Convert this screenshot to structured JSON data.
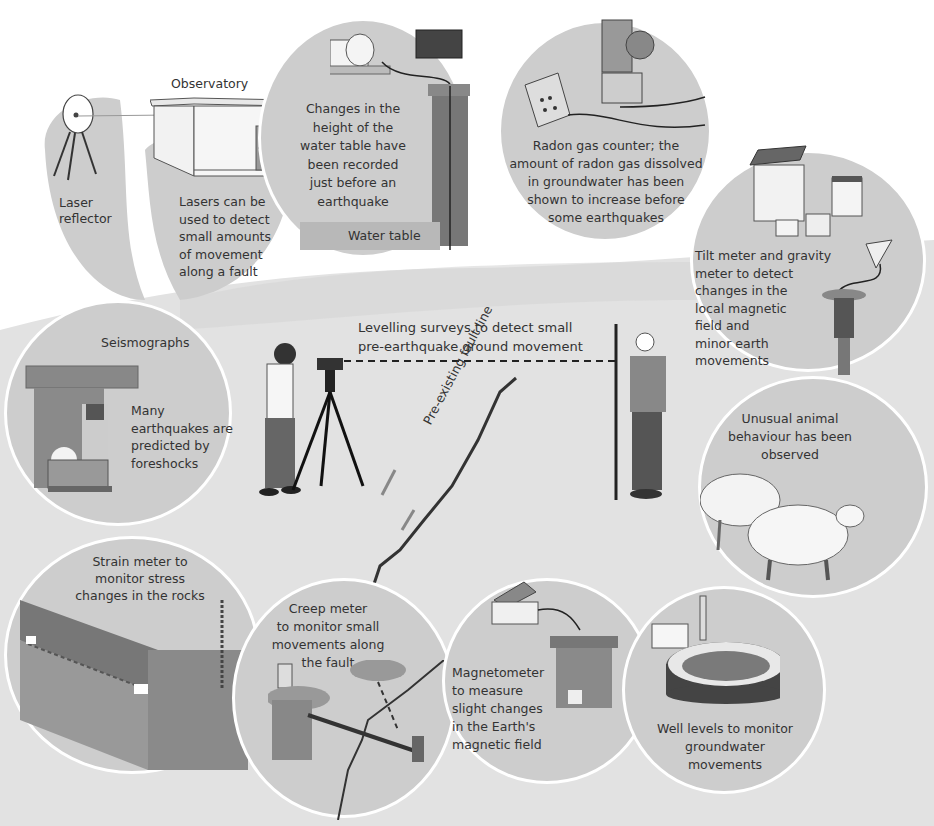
{
  "diagram": {
    "title_cropped": "",
    "theme_colors": {
      "background": "#ffffff",
      "ground": "#e2e2e2",
      "circle_fill": "#cdcdcd",
      "circle_border": "#ffffff",
      "dark_shape": "#555555",
      "text": "#333333"
    },
    "central": {
      "levelling_label": "Levelling surveys to detect small\npre-earthquake ground movement",
      "fault_label": "Pre-existing fault line"
    },
    "panels": [
      {
        "id": "laser",
        "label": "Laser\nreflector",
        "icon": "laser-reflector-icon"
      },
      {
        "id": "observatory",
        "title": "Observatory",
        "label": "Lasers can be\nused to detect\nsmall amounts\nof movement\nalong a fault",
        "icon": "observatory-building-icon"
      },
      {
        "id": "water-table",
        "label": "Changes in the\nheight of the\nwater table have\nbeen recorded\njust before an\nearthquake",
        "sublabel": "Water table",
        "icon": "water-table-well-icon"
      },
      {
        "id": "radon",
        "label": "Radon gas counter; the\namount of radon gas dissolved\nin groundwater has been\nshown to increase before\nsome earthquakes",
        "icon": "radon-counter-icon"
      },
      {
        "id": "tilt",
        "label": "Tilt meter and gravity\nmeter to detect\nchanges in the\nlocal magnetic\nfield and\nminor earth\nmovements",
        "icon": "tilt-meter-icon"
      },
      {
        "id": "seismographs",
        "title": "Seismographs",
        "label": "Many\nearthquakes are\npredicted by\nforeshocks",
        "icon": "seismograph-icon"
      },
      {
        "id": "animals",
        "label": "Unusual animal\nbehaviour has been\nobserved",
        "icon": "sheep-icon"
      },
      {
        "id": "strain",
        "label": "Strain meter to\nmonitor stress\nchanges in the rocks",
        "icon": "strain-meter-icon"
      },
      {
        "id": "creep",
        "label": "Creep meter\nto monitor small\nmovements along\nthe fault",
        "icon": "creep-meter-icon"
      },
      {
        "id": "magnetometer",
        "label": "Magnetometer\nto measure\nslight changes\nin the Earth's\nmagnetic field",
        "icon": "magnetometer-icon"
      },
      {
        "id": "well",
        "label": "Well levels to monitor\ngroundwater\nmovements",
        "icon": "well-icon"
      }
    ]
  }
}
